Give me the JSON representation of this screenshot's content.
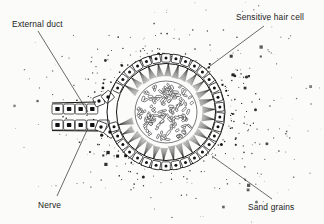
{
  "figure": {
    "kind": "biological-line-diagram",
    "background_color": "#fbfbf9",
    "ink_color": "#1a1a1a"
  },
  "labels": [
    {
      "id": "external-duct",
      "text": "External duct",
      "text_x": 12,
      "text_y": 27,
      "anchor": "start",
      "leader": {
        "x1": 38,
        "y1": 31,
        "x2": 88,
        "y2": 112
      }
    },
    {
      "id": "sensitive-hair-cell",
      "text": "Sensitive hair cell",
      "text_x": 236,
      "text_y": 20,
      "anchor": "start",
      "leader": {
        "x1": 264,
        "y1": 26,
        "x2": 206,
        "y2": 69
      }
    },
    {
      "id": "nerve",
      "text": "Nerve",
      "text_x": 38,
      "text_y": 208,
      "anchor": "start",
      "leader": {
        "x1": 57,
        "y1": 196,
        "x2": 88,
        "y2": 128
      }
    },
    {
      "id": "sand-grains",
      "text": "Sand grains",
      "text_x": 248,
      "text_y": 210,
      "anchor": "start",
      "leader": {
        "x1": 212,
        "y1": 156,
        "x2": 272,
        "y2": 199
      }
    }
  ],
  "structures": {
    "sac": {
      "cx": 166,
      "cy": 112,
      "rx": 59,
      "ry": 58,
      "cell_count": 34
    },
    "statolith": {
      "cx": 166,
      "cy": 112,
      "r": 31,
      "grain_count": 150
    },
    "duct": {
      "upper_row_cells": 4,
      "lower_row_cells": 5,
      "cell_width": 11,
      "cell_height": 10
    },
    "hair_bundles": 30,
    "sand_field": {
      "dot_count": 430,
      "inner_radius": 60,
      "outer_radius": 150
    }
  }
}
